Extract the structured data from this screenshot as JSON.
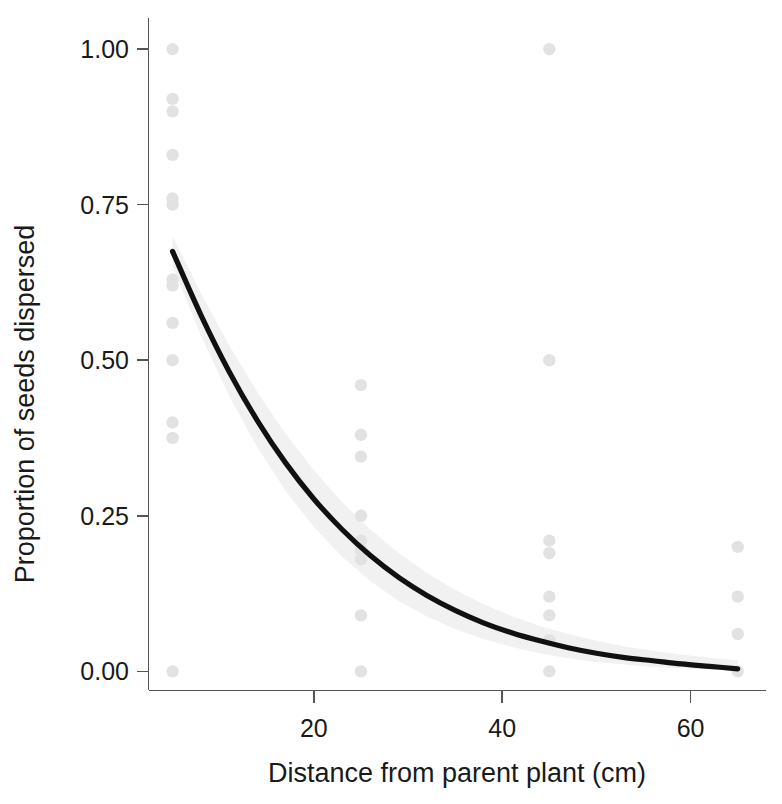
{
  "chart_data": {
    "type": "scatter",
    "title": "",
    "subtitle": "",
    "xlabel": "Distance from parent plant (cm)",
    "ylabel": "Proportion of seeds dispersed",
    "xlim": [
      2.5,
      68
    ],
    "ylim": [
      -0.03,
      1.05
    ],
    "xticks": [
      20,
      40,
      60
    ],
    "xtick_labels": [
      "20",
      "40",
      "60"
    ],
    "yticks": [
      0.0,
      0.25,
      0.5,
      0.75,
      1.0
    ],
    "ytick_labels": [
      "0.00",
      "0.25",
      "0.50",
      "0.75",
      "1.00"
    ],
    "grid": false,
    "legend": "none",
    "point_color": "#e2e2e2",
    "line_color": "#111111",
    "band_color": "#f1f1f1",
    "axis_color": "#555555",
    "background": "#ffffff",
    "series": [
      {
        "name": "Observed proportions",
        "type": "scatter",
        "x": [
          5,
          5,
          5,
          5,
          5,
          5,
          5,
          5,
          5,
          5,
          5,
          5,
          5,
          25,
          25,
          25,
          25,
          25,
          25,
          25,
          25,
          25,
          45,
          45,
          45,
          45,
          45,
          45,
          45,
          45,
          65,
          65,
          65,
          65
        ],
        "y": [
          1.0,
          0.92,
          0.9,
          0.83,
          0.76,
          0.75,
          0.63,
          0.62,
          0.56,
          0.5,
          0.4,
          0.375,
          0.0,
          0.46,
          0.38,
          0.345,
          0.25,
          0.21,
          0.195,
          0.18,
          0.09,
          0.0,
          1.0,
          0.5,
          0.21,
          0.19,
          0.12,
          0.09,
          0.05,
          0.0,
          0.2,
          0.12,
          0.06,
          0.0
        ]
      },
      {
        "name": "Fitted exponential decay",
        "type": "line",
        "x": [
          5,
          8,
          11,
          14,
          17,
          20,
          23,
          26,
          29,
          32,
          35,
          38,
          41,
          44,
          47,
          50,
          53,
          56,
          59,
          62,
          65
        ],
        "y": [
          0.675,
          0.573,
          0.482,
          0.403,
          0.335,
          0.277,
          0.228,
          0.186,
          0.151,
          0.122,
          0.098,
          0.078,
          0.062,
          0.049,
          0.038,
          0.029,
          0.022,
          0.017,
          0.012,
          0.008,
          0.004
        ]
      },
      {
        "name": "95% confidence band (upper)",
        "type": "line",
        "x": [
          5,
          8,
          11,
          14,
          17,
          20,
          23,
          26,
          29,
          32,
          35,
          38,
          41,
          44,
          47,
          50,
          53,
          56,
          59,
          62,
          65
        ],
        "y": [
          0.7,
          0.608,
          0.524,
          0.449,
          0.382,
          0.323,
          0.272,
          0.228,
          0.19,
          0.158,
          0.131,
          0.108,
          0.089,
          0.073,
          0.06,
          0.049,
          0.04,
          0.033,
          0.027,
          0.022,
          0.018
        ]
      },
      {
        "name": "95% confidence band (lower)",
        "type": "line",
        "x": [
          5,
          8,
          11,
          14,
          17,
          20,
          23,
          26,
          29,
          32,
          35,
          38,
          41,
          44,
          47,
          50,
          53,
          56,
          59,
          62,
          65
        ],
        "y": [
          0.652,
          0.54,
          0.443,
          0.36,
          0.29,
          0.232,
          0.184,
          0.145,
          0.113,
          0.088,
          0.068,
          0.052,
          0.039,
          0.029,
          0.021,
          0.015,
          0.011,
          0.007,
          0.005,
          0.003,
          0.001
        ]
      }
    ]
  }
}
